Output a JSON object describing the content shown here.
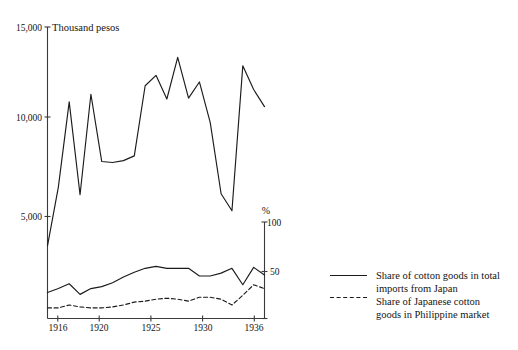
{
  "chart_data": {
    "type": "line",
    "title": "",
    "xlabel": "",
    "ylabel": "Thousand pesos",
    "y2label": "%",
    "grid": false,
    "legend_position": "right",
    "x": [
      1916,
      1917,
      1918,
      1919,
      1920,
      1921,
      1922,
      1923,
      1924,
      1925,
      1926,
      1927,
      1928,
      1929,
      1930,
      1931,
      1932,
      1933,
      1934,
      1935,
      1936
    ],
    "xlim": [
      1916,
      1936
    ],
    "xticks": [
      1916,
      1920,
      1925,
      1930,
      1936
    ],
    "xtick_labels": [
      "1916",
      "1920",
      "1925",
      "1930",
      "1936"
    ],
    "ylim": [
      0,
      15000
    ],
    "yticks": [
      5000,
      10000,
      15000
    ],
    "ytick_labels": [
      "5,000",
      "10,000",
      "15,000"
    ],
    "y2lim": [
      0,
      100
    ],
    "y2ticks": [
      0,
      50,
      100
    ],
    "y2tick_labels": [
      "0",
      "50",
      "100"
    ],
    "series": [
      {
        "name": "Imports of cotton goods from Japan",
        "unit": "Thousand pesos",
        "axis": "left",
        "style": "solid",
        "values": [
          3450,
          6550,
          11050,
          6150,
          11450,
          7900,
          7850,
          7950,
          8200,
          11900,
          12450,
          11200,
          13400,
          11250,
          12100,
          9950,
          6200,
          5300,
          12950,
          11700,
          10800
        ]
      },
      {
        "name": "Share of cotton goods in total imports from Japan",
        "unit": "%",
        "axis": "right",
        "style": "solid",
        "values": [
          27,
          31,
          36,
          25,
          31,
          33,
          37,
          43,
          48,
          52,
          54,
          52,
          52,
          52,
          44,
          44,
          47,
          52,
          35,
          53,
          45
        ]
      },
      {
        "name": "Share of Japanese cotton goods in Philippine market",
        "unit": "%",
        "axis": "right",
        "style": "dashed",
        "values": [
          11,
          11,
          14,
          12,
          11,
          11,
          12,
          14,
          17,
          18,
          20,
          21,
          20,
          18,
          22,
          22,
          20,
          14,
          24,
          35,
          31
        ]
      }
    ],
    "legend": [
      {
        "label_line1": "Share of cotton goods in total",
        "label_line2": "imports from Japan",
        "style": "solid"
      },
      {
        "label_line1": "Share of Japanese cotton",
        "label_line2": "goods in Philippine market",
        "style": "dashed"
      }
    ],
    "colors": {
      "ink": "#1b1b1b",
      "axis": "#3a3a3a",
      "background": "#ffffff"
    }
  },
  "axes": {
    "left_unit_label": "Thousand pesos",
    "right_unit_label": "%"
  }
}
